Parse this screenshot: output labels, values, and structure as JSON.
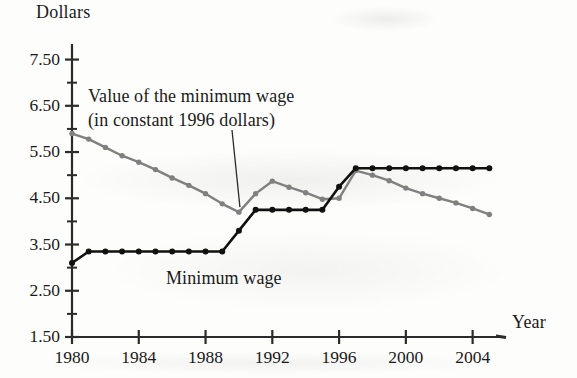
{
  "figure": {
    "y_axis_title": "Dollars",
    "x_axis_title": "Year",
    "series_labels": {
      "real_line_1": "Value of the minimum wage",
      "real_line_2": "(in constant 1996 dollars)",
      "nominal_line": "Minimum wage"
    },
    "colors": {
      "nominal_line": "#111111",
      "real_line": "#808080",
      "axis": "#2b2b2b",
      "background": "#fdfdfc"
    }
  },
  "chart_data": {
    "type": "line",
    "title": "",
    "subtitle": "",
    "xlabel": "Year",
    "ylabel": "Dollars",
    "xlim": [
      1980,
      2005.4
    ],
    "ylim": [
      1.5,
      7.75
    ],
    "grid": false,
    "legend": "inline-annotations",
    "y_major_ticks": [
      1.5,
      2.5,
      3.5,
      4.5,
      5.5,
      6.5,
      7.5
    ],
    "y_tick_labels": [
      "1.50",
      "2.50",
      "3.50",
      "4.50",
      "5.50",
      "6.50",
      "7.50"
    ],
    "y_minor_ticks": [
      2.0,
      3.0,
      4.0,
      5.0,
      6.0,
      7.0
    ],
    "x_major_ticks": [
      1980,
      1984,
      1988,
      1992,
      1996,
      2000,
      2004
    ],
    "x_tick_labels": [
      "1980",
      "1984",
      "1988",
      "1992",
      "1996",
      "2000",
      "2004"
    ],
    "x": [
      1980,
      1981,
      1982,
      1983,
      1984,
      1985,
      1986,
      1987,
      1988,
      1989,
      1990,
      1991,
      1992,
      1993,
      1994,
      1995,
      1996,
      1997,
      1998,
      1999,
      2000,
      2001,
      2002,
      2003,
      2004,
      2005
    ],
    "series": [
      {
        "name": "Value of the minimum wage (in constant 1996 dollars)",
        "color": "#808080",
        "marker": "circle",
        "values": [
          5.9,
          5.78,
          5.6,
          5.42,
          5.28,
          5.12,
          4.94,
          4.78,
          4.6,
          4.38,
          4.2,
          4.6,
          4.87,
          4.74,
          4.62,
          4.48,
          4.5,
          5.1,
          5.0,
          4.88,
          4.72,
          4.6,
          4.5,
          4.4,
          4.28,
          4.15
        ]
      },
      {
        "name": "Minimum wage",
        "color": "#111111",
        "marker": "circle",
        "values": [
          3.1,
          3.35,
          3.35,
          3.35,
          3.35,
          3.35,
          3.35,
          3.35,
          3.35,
          3.35,
          3.8,
          4.25,
          4.25,
          4.25,
          4.25,
          4.25,
          4.75,
          5.15,
          5.15,
          5.15,
          5.15,
          5.15,
          5.15,
          5.15,
          5.15,
          5.15
        ]
      }
    ],
    "annotations": [
      {
        "text": "Value of the minimum wage",
        "line2": "(in constant 1996 dollars)",
        "points_to_series": "Value of the minimum wage (in constant 1996 dollars)",
        "points_to_x": 1990
      },
      {
        "text": "Minimum wage",
        "points_to_series": "Minimum wage"
      }
    ]
  }
}
